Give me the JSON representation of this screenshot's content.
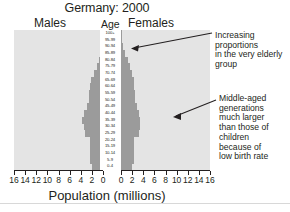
{
  "chart_data": {
    "type": "bar",
    "title": "Germany: 2000",
    "subtitle_left": "Males",
    "subtitle_center": "Age",
    "subtitle_right": "Females",
    "xlabel": "Population (millions)",
    "ylabel": "Age",
    "orientation": "horizontal-pyramid",
    "grid": false,
    "legend": "none",
    "xlim_left": [
      16,
      0
    ],
    "xlim_right": [
      0,
      16
    ],
    "xticks_left": [
      "16",
      "14",
      "12",
      "10",
      "8",
      "6",
      "4",
      "2",
      "0"
    ],
    "xticks_right": [
      "0",
      "2",
      "4",
      "6",
      "8",
      "10",
      "12",
      "14",
      "16"
    ],
    "xtick_values": [
      0,
      2,
      4,
      6,
      8,
      10,
      12,
      14,
      16
    ],
    "categories": [
      "0-4",
      "5-9",
      "10-14",
      "15-19",
      "20-24",
      "25-29",
      "30-34",
      "35-39",
      "40-44",
      "45-49",
      "50-54",
      "55-59",
      "60-64",
      "65-69",
      "70-74",
      "75-79",
      "80-84",
      "85-89",
      "90-94",
      "95-99",
      "100+"
    ],
    "series": [
      {
        "name": "Males",
        "side": "left",
        "color": "#9b9b9b",
        "values": [
          2.0,
          2.4,
          2.4,
          2.4,
          2.4,
          3.3,
          3.5,
          3.7,
          3.4,
          2.9,
          2.5,
          2.5,
          2.3,
          2.1,
          1.6,
          1.1,
          0.8,
          0.4,
          0.2,
          0.1,
          0.05
        ]
      },
      {
        "name": "Females",
        "side": "right",
        "color": "#9b9b9b",
        "values": [
          1.9,
          2.3,
          2.3,
          2.3,
          2.3,
          3.2,
          3.4,
          3.5,
          3.3,
          2.8,
          2.5,
          2.5,
          2.4,
          2.3,
          2.0,
          1.6,
          1.3,
          0.8,
          0.4,
          0.15,
          0.05
        ]
      }
    ],
    "plot_background": "#e4e4e4",
    "bar_color": "#9b9b9b"
  },
  "annotations": {
    "elderly": "Increasing\nproportions\nin the very elderly\ngroup",
    "middle_aged": "Middle-aged\ngenerations\nmuch larger\nthan those of\nchildren\nbecause of\nlow birth rate"
  }
}
